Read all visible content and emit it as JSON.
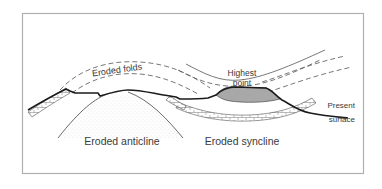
{
  "diagram": {
    "type": "geological cross-section",
    "labels": {
      "eroded_folds": "Eroded folds",
      "highest_point_line1": "Highest",
      "highest_point_line2": "point",
      "present_surface_line1": "Present",
      "present_surface_line2": "surface",
      "eroded_anticline": "Eroded anticline",
      "eroded_syncline": "Eroded syncline"
    },
    "colors": {
      "frame": "#b0b0b0",
      "surface_line": "#1a1a1a",
      "fold_lines": "#555555",
      "highest_point_fill": "#a8a8a8",
      "stipple": "#9a9a9a",
      "text": "#3a3a3a"
    }
  }
}
